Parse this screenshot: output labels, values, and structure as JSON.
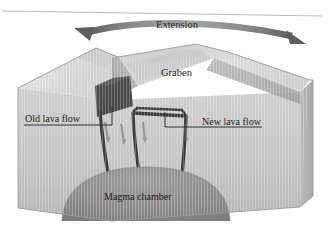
{
  "figure": {
    "type": "geologic-block-diagram",
    "top_rule": true,
    "labels": {
      "extension": "Extension",
      "graben": "Graben",
      "old_lava_flow": "Old lava flow",
      "new_lava_flow": "New lava flow",
      "magma_chamber": "Magma chamber"
    },
    "icons": {
      "extension_arrow": "double-headed-curved-arrow",
      "motion_arrows": "downward-slip-arrows"
    },
    "colors": {
      "page_background": "#ffffff",
      "block_front_face": "#c7c7c7",
      "block_top_surface": "#dcdcdc",
      "block_side_face": "#b4b4b4",
      "graben_floor": "#cccccc",
      "fault_scarp": "#a8a8a8",
      "old_lava_block": "#4a4a4a",
      "dike_conduit": "#3d3d3d",
      "magma_chamber": "#8e8e8e",
      "extension_arrow": "#6e6e6e",
      "leader_line": "#222222",
      "top_rule": "#b9b9b9",
      "text": "#1c1c1c"
    }
  }
}
